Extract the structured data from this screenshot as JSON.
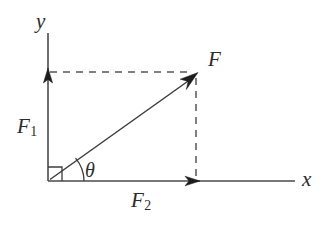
{
  "figure": {
    "type": "vector-decomposition-diagram",
    "background_color": "#ffffff",
    "line_color": "#3c3c3c",
    "axis_color": "#4a4a4a",
    "dash_color": "#555555"
  },
  "axes": {
    "x_label": "x",
    "y_label": "y",
    "origin": {
      "x": 48,
      "y": 181
    },
    "x_end": {
      "x": 295,
      "y": 181
    },
    "y_end": {
      "x": 48,
      "y": 33
    }
  },
  "vectors": [
    {
      "name": "resultant",
      "label": "F",
      "from": {
        "x": 48,
        "y": 181
      },
      "to": {
        "x": 196,
        "y": 75
      }
    },
    {
      "name": "y-component",
      "label": "F",
      "subscript": "1",
      "from": {
        "x": 48,
        "y": 181
      },
      "to": {
        "x": 48,
        "y": 72
      }
    },
    {
      "name": "x-component",
      "label": "F",
      "subscript": "2",
      "from": {
        "x": 48,
        "y": 181
      },
      "to": {
        "x": 196,
        "y": 181
      }
    }
  ],
  "angle": {
    "label": "θ",
    "name": "theta",
    "vertex": {
      "x": 48,
      "y": 181
    },
    "between": [
      "x-axis",
      "resultant"
    ]
  },
  "markers": {
    "right_angle_square": {
      "x": 48,
      "y": 181,
      "size": 14
    }
  },
  "guides": [
    {
      "name": "horizontal-projection",
      "style": "dashed",
      "from": {
        "x": 48,
        "y": 72
      },
      "to": {
        "x": 196,
        "y": 72
      }
    },
    {
      "name": "vertical-projection",
      "style": "dashed",
      "from": {
        "x": 196,
        "y": 75
      },
      "to": {
        "x": 196,
        "y": 181
      }
    }
  ],
  "labels": {
    "y_axis": "y",
    "x_axis": "x",
    "resultant": "F",
    "component_y_base": "F",
    "component_y_sub": "1",
    "component_x_base": "F",
    "component_x_sub": "2",
    "angle": "θ"
  }
}
